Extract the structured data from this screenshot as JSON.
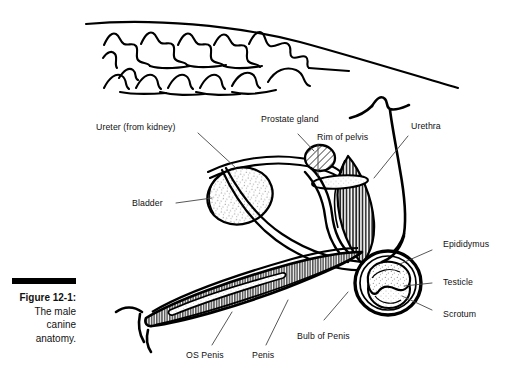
{
  "figure": {
    "caption_rule": "black-bar",
    "caption_number": "Figure 12-1:",
    "caption_line_1": "The male",
    "caption_line_2": "canine",
    "caption_line_3": "anatomy."
  },
  "colors": {
    "ink": "#111111",
    "line": "#000000",
    "background": "#ffffff",
    "hatch": "#1a1a1a",
    "stipple": "#555555"
  },
  "labels": {
    "ureter": "Ureter (from kidney)",
    "prostate": "Prostate gland",
    "rim_of_pelvis": "Rim of pelvis",
    "urethra": "Urethra",
    "bladder": "Bladder",
    "epididymus": "Epididymus",
    "testicle": "Testicle",
    "scrotum": "Scrotum",
    "bulb_of_penis": "Bulb of Penis",
    "penis": "Penis",
    "os_penis": "OS Penis"
  },
  "anatomy_parts": [
    "spine-vertebrae",
    "body-outline",
    "bladder",
    "ureter-tube",
    "prostate-gland",
    "rim-of-pelvis",
    "urethra",
    "vas-deferens",
    "epididymus",
    "testicle",
    "scrotum",
    "bulb-of-penis",
    "penis-shaft",
    "os-penis"
  ]
}
